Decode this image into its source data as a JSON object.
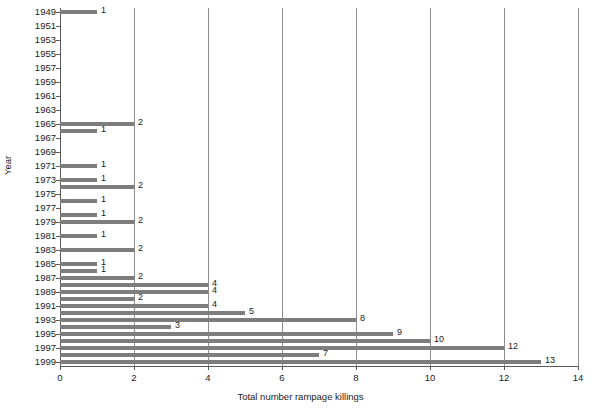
{
  "chart_data": {
    "type": "bar",
    "orientation": "horizontal",
    "title": "",
    "xlabel": "Total number rampage killings",
    "ylabel": "Year",
    "xlim": [
      0,
      14
    ],
    "ylim": [
      1949,
      2000
    ],
    "grid": true,
    "gridline_axis": "x",
    "legend": null,
    "x_ticks": [
      "0",
      "2",
      "4",
      "6",
      "8",
      "10",
      "12",
      "14"
    ],
    "x_tick_values": [
      0,
      2,
      4,
      6,
      8,
      10,
      12,
      14
    ],
    "y_ticks": [
      "1949",
      "1951",
      "1953",
      "1955",
      "1957",
      "1959",
      "1961",
      "1963",
      "1965",
      "1967",
      "1969",
      "1971",
      "1973",
      "1975",
      "1977",
      "1979",
      "1981",
      "1983",
      "1985",
      "1987",
      "1989",
      "1991",
      "1993",
      "1995",
      "1997",
      "1999"
    ],
    "y_tick_values": [
      1949,
      1951,
      1953,
      1955,
      1957,
      1959,
      1961,
      1963,
      1965,
      1967,
      1969,
      1971,
      1973,
      1975,
      1977,
      1979,
      1981,
      1983,
      1985,
      1987,
      1989,
      1991,
      1993,
      1995,
      1997,
      1999
    ],
    "categories": [
      1949,
      1950,
      1951,
      1952,
      1953,
      1954,
      1955,
      1956,
      1957,
      1958,
      1959,
      1960,
      1961,
      1962,
      1963,
      1964,
      1965,
      1966,
      1967,
      1968,
      1969,
      1970,
      1971,
      1972,
      1973,
      1974,
      1975,
      1976,
      1977,
      1978,
      1979,
      1980,
      1981,
      1982,
      1983,
      1984,
      1985,
      1986,
      1987,
      1988,
      1989,
      1990,
      1991,
      1992,
      1993,
      1994,
      1995,
      1996,
      1997,
      1998,
      1999
    ],
    "values": [
      1,
      0,
      0,
      0,
      0,
      0,
      0,
      0,
      0,
      0,
      0,
      0,
      0,
      0,
      0,
      0,
      2,
      1,
      0,
      0,
      0,
      1,
      1,
      0,
      2,
      1,
      1,
      2,
      0,
      1,
      2,
      0,
      1,
      1,
      2,
      1,
      1,
      2,
      4,
      4,
      2,
      4,
      5,
      8,
      3,
      9,
      10,
      12,
      7,
      13,
      0
    ],
    "bars": [
      {
        "year": 1949,
        "value": 1,
        "label": "1"
      },
      {
        "year": 1965,
        "value": 2,
        "label": "2"
      },
      {
        "year": 1966,
        "value": 1,
        "label": "1"
      },
      {
        "year": 1971,
        "value": 1,
        "label": "1"
      },
      {
        "year": 1973,
        "value": 1,
        "label": "1"
      },
      {
        "year": 1974,
        "value": 2,
        "label": "2"
      },
      {
        "year": 1976,
        "value": 1,
        "label": "1"
      },
      {
        "year": 1978,
        "value": 1,
        "label": "1"
      },
      {
        "year": 1979,
        "value": 2,
        "label": "2"
      },
      {
        "year": 1981,
        "value": 1,
        "label": "1"
      },
      {
        "year": 1983,
        "value": 2,
        "label": "2"
      },
      {
        "year": 1985,
        "value": 1,
        "label": "1"
      },
      {
        "year": 1986,
        "value": 1,
        "label": "1"
      },
      {
        "year": 1987,
        "value": 2,
        "label": "2"
      },
      {
        "year": 1988,
        "value": 4,
        "label": "4"
      },
      {
        "year": 1989,
        "value": 4,
        "label": "4"
      },
      {
        "year": 1990,
        "value": 2,
        "label": "2"
      },
      {
        "year": 1991,
        "value": 4,
        "label": "4"
      },
      {
        "year": 1992,
        "value": 5,
        "label": "5"
      },
      {
        "year": 1993,
        "value": 8,
        "label": "8"
      },
      {
        "year": 1994,
        "value": 3,
        "label": "3"
      },
      {
        "year": 1995,
        "value": 9,
        "label": "9"
      },
      {
        "year": 1996,
        "value": 10,
        "label": "10"
      },
      {
        "year": 1997,
        "value": 12,
        "label": "12"
      },
      {
        "year": 1998,
        "value": 7,
        "label": "7"
      },
      {
        "year": 1999,
        "value": 13,
        "label": "13"
      }
    ],
    "colors": {
      "bar": "#7d7d7d",
      "axis": "#5a5a5a",
      "grid": "#8e8e8e",
      "text": "#1a1a1a",
      "background": "#ffffff"
    }
  },
  "caption": {
    "ghost_text": ""
  }
}
